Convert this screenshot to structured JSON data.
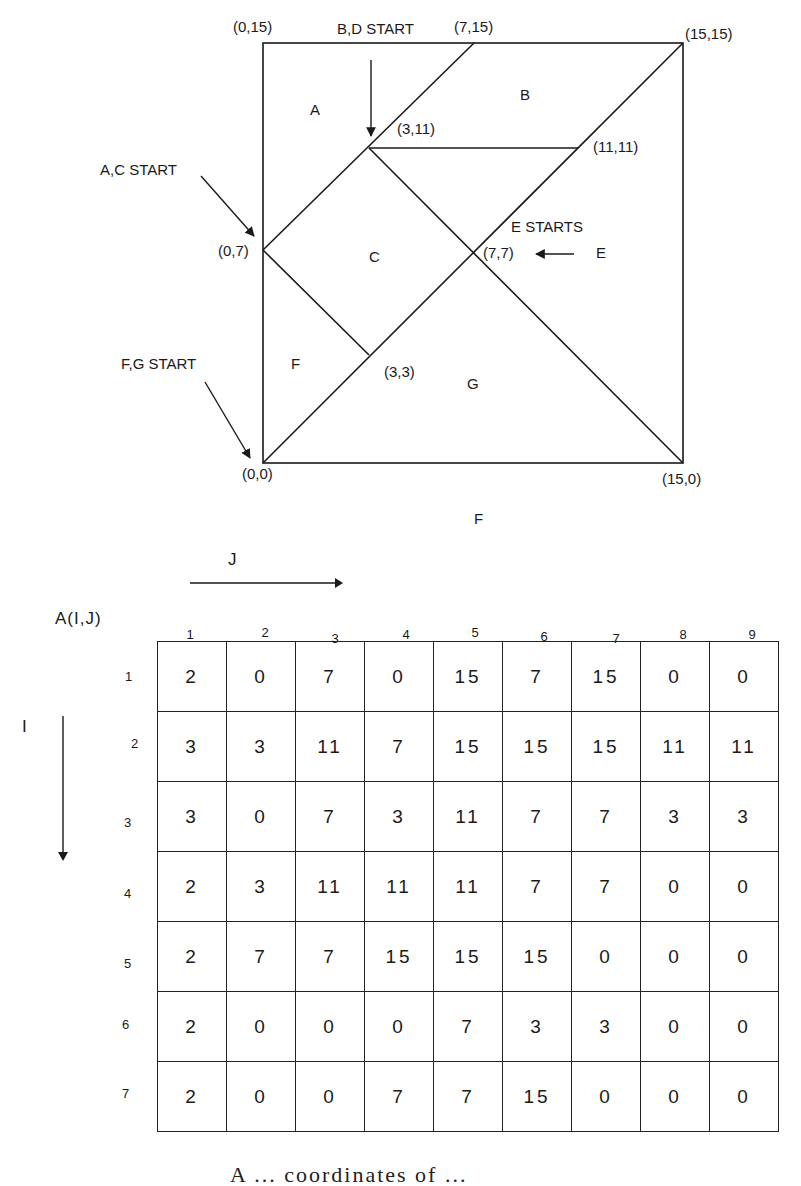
{
  "diagram": {
    "corners": {
      "top_left": "(0,15)",
      "top_mid": "(7,15)",
      "top_right": "(15,15)",
      "left_mid": "(0,7)",
      "bottom_left": "(0,0)",
      "bottom_right": "(15,0)"
    },
    "points": {
      "p3_11": "(3,11)",
      "p11_11": "(11,11)",
      "p7_7": "(7,7)",
      "p3_3": "(3,3)"
    },
    "pieces": [
      "A",
      "B",
      "C",
      "F",
      "G"
    ],
    "piece_labels": {
      "A": "A",
      "B": "B",
      "C": "C",
      "F": "F",
      "G": "G",
      "E": "E",
      "F_bottom": "F"
    },
    "annotations": {
      "bd_start": "B,D START",
      "ac_start": "A,C START",
      "e_starts": "E STARTS",
      "fg_start": "F,G START"
    }
  },
  "matrix": {
    "title": "A(I,J)",
    "j_axis_label": "J",
    "i_axis_label": "I",
    "column_headers": [
      "1",
      "2",
      "3",
      "4",
      "5",
      "6",
      "7",
      "8",
      "9"
    ],
    "row_headers": [
      "1",
      "2",
      "3",
      "4",
      "5",
      "6",
      "7"
    ],
    "rows": [
      [
        "2",
        "0",
        "7",
        "0",
        "15",
        "7",
        "15",
        "0",
        "0"
      ],
      [
        "3",
        "3",
        "11",
        "7",
        "15",
        "15",
        "15",
        "11",
        "11"
      ],
      [
        "3",
        "0",
        "7",
        "3",
        "11",
        "7",
        "7",
        "3",
        "3"
      ],
      [
        "2",
        "3",
        "11",
        "11",
        "11",
        "7",
        "7",
        "0",
        "0"
      ],
      [
        "2",
        "7",
        "7",
        "15",
        "15",
        "15",
        "0",
        "0",
        "0"
      ],
      [
        "2",
        "0",
        "0",
        "0",
        "7",
        "3",
        "3",
        "0",
        "0"
      ],
      [
        "2",
        "0",
        "0",
        "7",
        "7",
        "15",
        "0",
        "0",
        "0"
      ]
    ]
  },
  "caption": {
    "text_clipped": "A ... coordinates of ... "
  }
}
